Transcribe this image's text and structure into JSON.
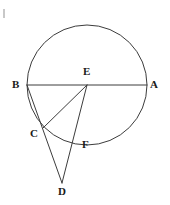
{
  "figure": {
    "width": 170,
    "height": 205,
    "background_color": "#ffffff",
    "stroke_color": "#3c3c3c",
    "label_color": "#1a1a1a",
    "stroke_width": 1
  },
  "circle": {
    "name": "main-circle",
    "center_x": 87,
    "center_y": 85,
    "radius": 60
  },
  "points": {
    "A": {
      "label": "A",
      "x": 147,
      "y": 85,
      "label_x": 150,
      "label_y": 79,
      "on_circle": true
    },
    "B": {
      "label": "B",
      "x": 27,
      "y": 85,
      "label_x": 12,
      "label_y": 79,
      "on_circle": true
    },
    "C": {
      "label": "C",
      "x": 43,
      "y": 128,
      "label_x": 30,
      "label_y": 128,
      "on_circle": true
    },
    "D": {
      "label": "D",
      "x": 62,
      "y": 183,
      "label_x": 58,
      "label_y": 186,
      "on_circle": false
    },
    "E": {
      "label": "E",
      "x": 87,
      "y": 85,
      "label_x": 83,
      "label_y": 66,
      "on_circle": false
    },
    "F": {
      "label": "F",
      "x": 77,
      "y": 141,
      "label_x": 82,
      "label_y": 139,
      "on_circle": true
    }
  },
  "segments": [
    {
      "name": "segment-BA-diameter",
      "from": "B",
      "to": "A",
      "x1": 27,
      "y1": 85,
      "x2": 147,
      "y2": 85
    },
    {
      "name": "segment-BD-secant",
      "from": "B",
      "to": "D",
      "x1": 27,
      "y1": 85,
      "x2": 62,
      "y2": 183
    },
    {
      "name": "segment-EC-radius",
      "from": "E",
      "to": "C",
      "x1": 87,
      "y1": 85,
      "x2": 43,
      "y2": 128
    },
    {
      "name": "segment-ED-secant",
      "from": "E",
      "to": "D",
      "x1": 87,
      "y1": 85,
      "x2": 62,
      "y2": 183
    }
  ]
}
